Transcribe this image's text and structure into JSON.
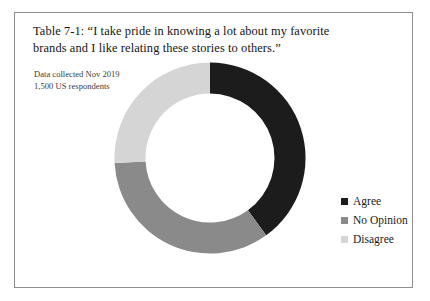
{
  "figure": {
    "caption": "Table 7-1: “I take pride in knowing a lot about my favorite brands and I like relating these stories to others.”",
    "note_line_1": "Data collected Nov 2019",
    "note_line_2": "1,500 US respondents",
    "border_color": "#8e8e8e"
  },
  "legend": {
    "items": [
      {
        "label": "Agree",
        "color": "#1c1c1c"
      },
      {
        "label": "No Opinion",
        "color": "#8a8a8a"
      },
      {
        "label": "Disagree",
        "color": "#d5d5d5"
      }
    ]
  },
  "chart_data": {
    "type": "pie",
    "variant": "donut",
    "title": "Table 7-1: “I take pride in knowing a lot about my favorite brands and I like relating these stories to others.”",
    "subtitle": "Data collected Nov 2019 / 1,500 US respondents",
    "xlabel": "",
    "ylabel": "",
    "categories": [
      "Agree",
      "No Opinion",
      "Disagree"
    ],
    "values": [
      40,
      34,
      26
    ],
    "value_unit": "percent",
    "start_angle_deg": 0,
    "direction": "clockwise",
    "segment_angles_deg": [
      144,
      123,
      93
    ],
    "colors": [
      "#1c1c1c",
      "#8a8a8a",
      "#d5d5d5"
    ],
    "inner_radius_ratio": 0.675,
    "legend_position": "right",
    "grid": false,
    "data_labels_shown": false,
    "slices": [
      {
        "name": "Agree",
        "value": 40,
        "color": "#1c1c1c",
        "start_deg": 0,
        "end_deg": 144
      },
      {
        "name": "No Opinion",
        "value": 34,
        "color": "#8a8a8a",
        "start_deg": 144,
        "end_deg": 267
      },
      {
        "name": "Disagree",
        "value": 26,
        "color": "#d5d5d5",
        "start_deg": 267,
        "end_deg": 360
      }
    ]
  }
}
